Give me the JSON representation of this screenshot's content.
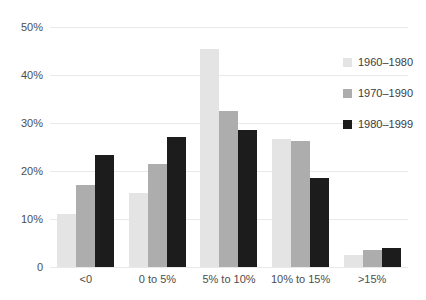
{
  "chart_data": {
    "type": "bar",
    "title": "",
    "xlabel": "",
    "ylabel": "",
    "categories": [
      "<0",
      "0 to 5%",
      "5% to 10%",
      "10% to 15%",
      ">15%"
    ],
    "series": [
      {
        "name": "1960–1980",
        "color": "#e4e4e4",
        "values": [
          11,
          15.5,
          45.5,
          26.7,
          2.5
        ]
      },
      {
        "name": "1970–1990",
        "color": "#adadad",
        "values": [
          17,
          21.5,
          32.5,
          26.3,
          3.5
        ]
      },
      {
        "name": "1980–1999",
        "color": "#1c1c1c",
        "values": [
          23.3,
          27,
          28.5,
          18.5,
          4
        ]
      }
    ],
    "ylim": [
      0,
      50
    ],
    "yticks": [
      0,
      10,
      20,
      30,
      40,
      50
    ],
    "yticklabels_top_to_bottom": [
      "50%",
      "40%",
      "30%",
      "20%",
      "10%",
      "0"
    ],
    "grid": true,
    "legend_position": "right"
  },
  "colors": {
    "background": "#ffffff",
    "gridline": "#e9e9e9",
    "axis_text": "#4d4d4d",
    "legend_text": "#3c3c3c"
  }
}
